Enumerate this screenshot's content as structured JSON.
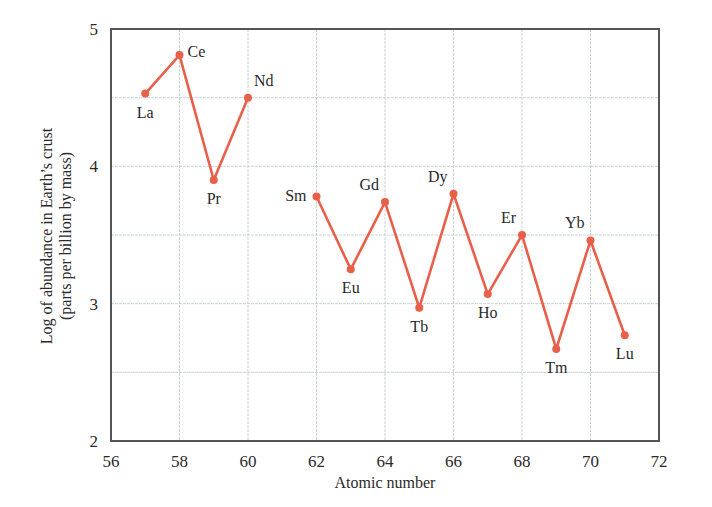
{
  "chart_data": {
    "type": "line",
    "title": "",
    "xlabel": "Atomic number",
    "ylabel": "Log of abundance in Earth’s crust",
    "ylabel_sub": "(parts per billion by mass)",
    "xlim": [
      56,
      72
    ],
    "ylim": [
      2,
      5
    ],
    "grid": true,
    "legend": null,
    "x_ticks": [
      56,
      58,
      60,
      62,
      64,
      66,
      68,
      70,
      72
    ],
    "y_ticks": [
      2,
      3,
      4,
      5
    ],
    "y_minor_grid": [
      2.5,
      3.5,
      4.5
    ],
    "line_color": "#e8604a",
    "segments": [
      {
        "name": "La-Nd",
        "points": [
          {
            "element": "La",
            "x": 57,
            "y": 4.53,
            "label_pos": "below"
          },
          {
            "element": "Ce",
            "x": 58,
            "y": 4.81,
            "label_pos": "right"
          },
          {
            "element": "Pr",
            "x": 59,
            "y": 3.9,
            "label_pos": "below"
          },
          {
            "element": "Nd",
            "x": 60,
            "y": 4.5,
            "label_pos": "above-right"
          }
        ]
      },
      {
        "name": "Sm-Lu",
        "points": [
          {
            "element": "Sm",
            "x": 62,
            "y": 3.78,
            "label_pos": "left"
          },
          {
            "element": "Eu",
            "x": 63,
            "y": 3.25,
            "label_pos": "below"
          },
          {
            "element": "Gd",
            "x": 64,
            "y": 3.74,
            "label_pos": "above-left"
          },
          {
            "element": "Tb",
            "x": 65,
            "y": 2.97,
            "label_pos": "below"
          },
          {
            "element": "Dy",
            "x": 66,
            "y": 3.8,
            "label_pos": "above-left"
          },
          {
            "element": "Ho",
            "x": 67,
            "y": 3.07,
            "label_pos": "below"
          },
          {
            "element": "Er",
            "x": 68,
            "y": 3.5,
            "label_pos": "above-left"
          },
          {
            "element": "Tm",
            "x": 69,
            "y": 2.67,
            "label_pos": "below"
          },
          {
            "element": "Yb",
            "x": 70,
            "y": 3.46,
            "label_pos": "above-left"
          },
          {
            "element": "Lu",
            "x": 71,
            "y": 2.77,
            "label_pos": "below"
          }
        ]
      }
    ]
  }
}
